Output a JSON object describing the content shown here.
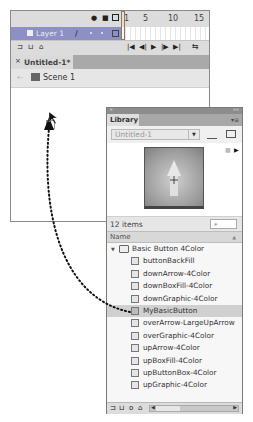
{
  "timeline": {
    "header_icons": [
      "eye-icon",
      "lock-icon",
      "outline-icon"
    ],
    "frame_numbers": [
      "1",
      "5",
      "10",
      "15"
    ],
    "layer": {
      "name": "Layer 1",
      "icons": [
        "pencil-icon",
        "dot",
        "dot",
        "outline-square"
      ]
    },
    "toolbar_left_icons": [
      "new-layer-icon",
      "new-folder-icon",
      "delete-icon"
    ],
    "playback_controls": [
      "|◀",
      "◀|",
      "▶",
      "|▶",
      "▶|"
    ],
    "loop_icon": "loop-icon"
  },
  "document": {
    "tab_close": "×",
    "tab_label": "Untitled-1*",
    "back_arrow": "←",
    "scene_label": "Scene 1"
  },
  "library": {
    "close": "×",
    "collapse": "««",
    "title": "Library",
    "menu_icon": "▾≡",
    "doc_select": "Untitled-1",
    "doc_select_arrow": "▼",
    "pin_icon": "pin-icon",
    "new_library_icon": "new-library-panel-icon",
    "preview_controls": [
      "■",
      "▶"
    ],
    "item_count": "12 items",
    "search_placeholder": "⌕",
    "column_name": "Name",
    "sort_icon": "▲",
    "items": [
      {
        "label": "Basic Button 4Color",
        "type": "folder",
        "indent": 0,
        "expanded": true
      },
      {
        "label": "buttonBackFill",
        "type": "graphic",
        "indent": 1
      },
      {
        "label": "downArrow-4Color",
        "type": "graphic",
        "indent": 1
      },
      {
        "label": "downBoxFill-4Color",
        "type": "graphic",
        "indent": 1
      },
      {
        "label": "downGraphic-4Color",
        "type": "graphic",
        "indent": 1
      },
      {
        "label": "MyBasicButton",
        "type": "button",
        "indent": 1,
        "selected": true
      },
      {
        "label": "overArrow-LargeUpArrow",
        "type": "graphic",
        "indent": 1
      },
      {
        "label": "overGraphic-4Color",
        "type": "graphic",
        "indent": 1
      },
      {
        "label": "upArrow-4Color",
        "type": "graphic",
        "indent": 1
      },
      {
        "label": "upBoxFill-4Color",
        "type": "graphic",
        "indent": 1
      },
      {
        "label": "upButtonBox-4Color",
        "type": "graphic",
        "indent": 1
      },
      {
        "label": "upGraphic-4Color",
        "type": "graphic",
        "indent": 1
      }
    ],
    "bottom_icons": [
      "new-symbol-icon",
      "new-folder-icon",
      "properties-icon",
      "delete-icon"
    ]
  },
  "annotation": {
    "type": "dotted-arrow",
    "from": "MyBasicButton",
    "to": "stage-instance"
  },
  "colors": {
    "layer_highlight": "#8c90c4",
    "panel_bg": "#f3f3f3",
    "selected_row": "#d0d0d0"
  }
}
